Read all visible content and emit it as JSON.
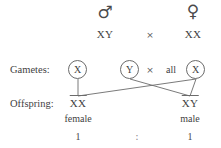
{
  "diagram": {
    "line_color": "#6b6b6b",
    "text_color": "#3f3f3f",
    "background": "#ffffff"
  },
  "parents": {
    "male": {
      "symbol": "♂",
      "symbol_name": "male-symbol",
      "genotype": "XY"
    },
    "female": {
      "symbol": "♀",
      "symbol_name": "female-symbol",
      "genotype": "XX"
    },
    "cross_operator": "×"
  },
  "rows": {
    "gametes_label": "Gametes:",
    "offspring_label": "Offspring:"
  },
  "gametes": {
    "male": [
      {
        "allele": "X"
      },
      {
        "allele": "Y"
      }
    ],
    "cross_operator": "×",
    "female_qualifier": "all",
    "female": [
      {
        "allele": "X"
      }
    ]
  },
  "offspring": [
    {
      "genotype": "XX",
      "sex": "female",
      "ratio": "1"
    },
    {
      "genotype": "XY",
      "sex": "male",
      "ratio": "1"
    }
  ],
  "ratio_separator": ":"
}
